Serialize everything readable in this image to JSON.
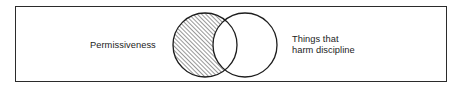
{
  "figure": {
    "type": "venn-diagram",
    "title": "",
    "frame": {
      "border_color": "#2b2b2b",
      "fill_color": "#ffffff"
    },
    "background_color": "#ffffff"
  },
  "labels": {
    "left": "Permissiveness",
    "right_line1": "Things that",
    "right_line2": "harm discipline"
  },
  "sets": [
    {
      "id": "permissiveness",
      "label": "Permissiveness",
      "fill": "hatched",
      "hatch_angle_degrees": 45,
      "hatch_color": "#5a5a5a",
      "stroke_color": "#1d1d1d",
      "center_x": 205,
      "center_y": 45,
      "radius": 32
    },
    {
      "id": "things-that-harm-discipline",
      "label": "Things that harm discipline",
      "fill": "none",
      "stroke_color": "#1d1d1d",
      "center_x": 245,
      "center_y": 45,
      "radius": 32
    }
  ],
  "intersection": {
    "label": "",
    "fill": "none",
    "shaded": false
  },
  "colors": {
    "stroke": "#1d1d1d",
    "frame": "#2b2b2b",
    "hatch": "#5a5a5a",
    "text": "#1d1d1d",
    "background": "#ffffff"
  }
}
